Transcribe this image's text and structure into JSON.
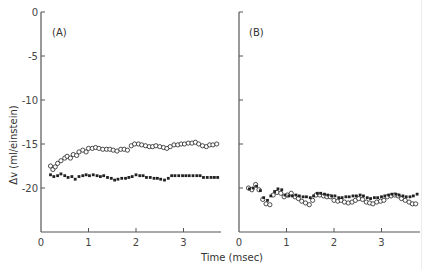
{
  "chart_data": [
    {
      "type": "scatter",
      "panel": "A",
      "panel_label": "(A)",
      "xlabel": "Time (msec)",
      "ylabel": "Δv (ml/einstein)",
      "xlim": [
        0,
        3.9
      ],
      "ylim": [
        -25,
        0
      ],
      "xticks": [
        0,
        1,
        2,
        3
      ],
      "yticks": [
        0,
        -5,
        -10,
        -15,
        -20
      ],
      "grid": false,
      "series": [
        {
          "name": "open circles",
          "marker": "open-circle",
          "x": [
            0.2,
            0.25,
            0.3,
            0.35,
            0.42,
            0.5,
            0.55,
            0.62,
            0.68,
            0.75,
            0.8,
            0.88,
            0.95,
            1.0,
            1.08,
            1.15,
            1.22,
            1.3,
            1.38,
            1.45,
            1.52,
            1.6,
            1.68,
            1.75,
            1.82,
            1.9,
            1.97,
            2.05,
            2.12,
            2.2,
            2.28,
            2.35,
            2.42,
            2.5,
            2.58,
            2.65,
            2.72,
            2.8,
            2.88,
            2.95,
            3.02,
            3.1,
            3.18,
            3.25,
            3.32,
            3.4,
            3.48,
            3.55,
            3.62,
            3.7
          ],
          "y": [
            -17.5,
            -17.9,
            -17.6,
            -17.2,
            -16.9,
            -16.6,
            -16.4,
            -16.6,
            -16.2,
            -16.3,
            -15.9,
            -15.7,
            -15.9,
            -15.5,
            -15.5,
            -15.4,
            -15.5,
            -15.6,
            -15.6,
            -15.6,
            -15.7,
            -15.8,
            -15.6,
            -15.6,
            -15.7,
            -15.2,
            -15.0,
            -15.0,
            -15.1,
            -15.2,
            -15.3,
            -15.3,
            -15.2,
            -15.3,
            -15.4,
            -15.5,
            -15.3,
            -15.1,
            -15.1,
            -15.0,
            -15.0,
            -14.9,
            -14.9,
            -14.8,
            -15.0,
            -15.2,
            -15.3,
            -15.1,
            -15.1,
            -15.0
          ]
        },
        {
          "name": "filled circles",
          "marker": "filled-circle",
          "x": [
            0.2,
            0.27,
            0.35,
            0.42,
            0.5,
            0.57,
            0.65,
            0.72,
            0.8,
            0.88,
            0.95,
            1.02,
            1.1,
            1.18,
            1.25,
            1.32,
            1.4,
            1.48,
            1.55,
            1.62,
            1.7,
            1.78,
            1.85,
            1.92,
            2.0,
            2.08,
            2.15,
            2.22,
            2.3,
            2.38,
            2.45,
            2.52,
            2.6,
            2.68,
            2.75,
            2.82,
            2.9,
            2.98,
            3.05,
            3.12,
            3.2,
            3.28,
            3.35,
            3.42,
            3.5,
            3.58,
            3.65,
            3.72
          ],
          "y": [
            -18.5,
            -18.7,
            -18.6,
            -18.4,
            -18.6,
            -18.8,
            -18.7,
            -19.0,
            -18.7,
            -18.6,
            -18.5,
            -18.6,
            -18.5,
            -18.6,
            -18.7,
            -18.6,
            -18.8,
            -18.9,
            -19.1,
            -19.0,
            -18.9,
            -18.9,
            -18.8,
            -18.7,
            -18.5,
            -18.6,
            -18.6,
            -18.8,
            -18.8,
            -18.9,
            -18.9,
            -19.0,
            -19.1,
            -18.9,
            -18.6,
            -18.6,
            -18.6,
            -18.6,
            -18.6,
            -18.6,
            -18.6,
            -18.6,
            -18.6,
            -18.8,
            -18.8,
            -18.8,
            -18.8,
            -18.8
          ]
        }
      ]
    },
    {
      "type": "scatter",
      "panel": "B",
      "panel_label": "(B)",
      "xlabel": "Time (msec)",
      "ylabel": "Δv (ml/einstein)",
      "xlim": [
        0,
        3.9
      ],
      "ylim": [
        -25,
        0
      ],
      "xticks": [
        0,
        1,
        2,
        3
      ],
      "yticks": [
        0,
        -5,
        -10,
        -15,
        -20
      ],
      "grid": false,
      "series": [
        {
          "name": "open circles",
          "marker": "open-circle",
          "x": [
            0.2,
            0.27,
            0.35,
            0.42,
            0.5,
            0.57,
            0.65,
            0.72,
            0.8,
            0.88,
            0.95,
            1.02,
            1.1,
            1.18,
            1.25,
            1.32,
            1.4,
            1.48,
            1.55,
            1.62,
            1.7,
            1.78,
            1.85,
            1.92,
            2.0,
            2.08,
            2.15,
            2.22,
            2.3,
            2.38,
            2.45,
            2.52,
            2.6,
            2.68,
            2.75,
            2.82,
            2.9,
            2.98,
            3.05,
            3.12,
            3.2,
            3.28,
            3.35,
            3.42,
            3.5,
            3.58,
            3.65,
            3.72
          ],
          "y": [
            -20.0,
            -20.2,
            -19.6,
            -20.2,
            -21.3,
            -21.8,
            -21.9,
            -20.8,
            -20.5,
            -20.6,
            -21.0,
            -20.8,
            -20.6,
            -21.0,
            -21.2,
            -21.5,
            -21.7,
            -21.9,
            -21.4,
            -20.8,
            -20.8,
            -20.9,
            -21.0,
            -21.0,
            -21.4,
            -21.5,
            -21.4,
            -21.6,
            -21.7,
            -21.6,
            -21.4,
            -21.2,
            -21.3,
            -21.6,
            -21.7,
            -21.8,
            -21.6,
            -21.5,
            -21.4,
            -21.0,
            -20.9,
            -20.8,
            -20.9,
            -21.2,
            -21.4,
            -21.6,
            -21.8,
            -21.8
          ]
        },
        {
          "name": "filled circles",
          "marker": "filled-circle",
          "x": [
            0.22,
            0.3,
            0.37,
            0.45,
            0.52,
            0.6,
            0.67,
            0.75,
            0.82,
            0.9,
            0.97,
            1.05,
            1.12,
            1.2,
            1.27,
            1.35,
            1.42,
            1.5,
            1.57,
            1.65,
            1.72,
            1.8,
            1.87,
            1.95,
            2.02,
            2.1,
            2.17,
            2.25,
            2.32,
            2.4,
            2.47,
            2.55,
            2.62,
            2.7,
            2.77,
            2.85,
            2.92,
            3.0,
            3.07,
            3.15,
            3.22,
            3.3,
            3.37,
            3.45,
            3.52,
            3.6,
            3.67,
            3.75
          ],
          "y": [
            -20.1,
            -20.0,
            -19.8,
            -20.3,
            -21.1,
            -21.4,
            -20.9,
            -20.4,
            -20.1,
            -20.2,
            -20.8,
            -20.9,
            -20.9,
            -20.8,
            -20.9,
            -21.0,
            -21.0,
            -21.1,
            -20.9,
            -20.6,
            -20.6,
            -20.7,
            -20.8,
            -20.9,
            -20.9,
            -21.1,
            -21.1,
            -21.0,
            -21.0,
            -20.9,
            -20.9,
            -20.8,
            -20.9,
            -21.1,
            -21.2,
            -21.1,
            -21.1,
            -21.0,
            -20.9,
            -20.8,
            -20.7,
            -20.7,
            -20.8,
            -20.9,
            -21.0,
            -21.0,
            -20.9,
            -20.7
          ]
        }
      ]
    }
  ],
  "figure": {
    "shared_xlabel": "Time (msec)",
    "shared_ylabel": "Δv (ml/einstein)",
    "colors": {
      "axis": "#555555",
      "marker": "#222222",
      "background": "#ffffff"
    }
  }
}
